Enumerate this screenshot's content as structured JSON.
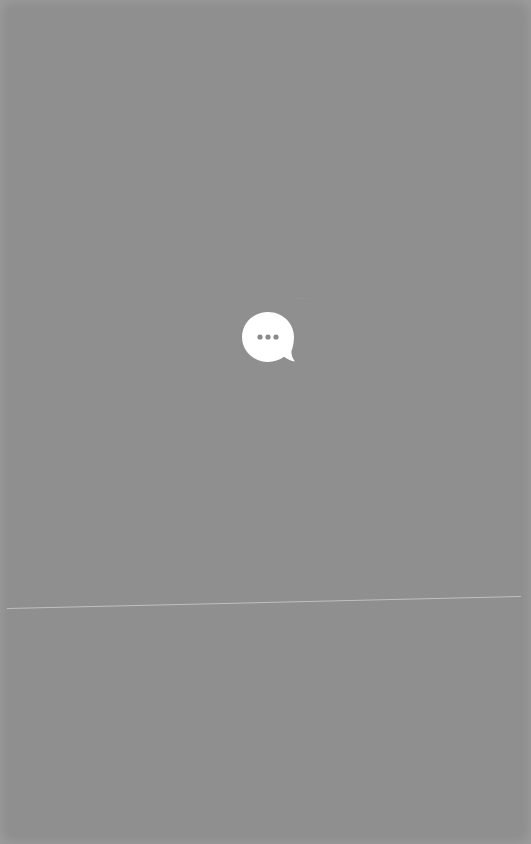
{
  "screen": {
    "state": "loading",
    "overlay_color": "#8f8f8f",
    "border_color": "#9b9b9b"
  },
  "loading_indicator": {
    "icon": "chat-bubble-ellipsis-icon",
    "bubble_color": "#ffffff",
    "dots_color": "#8a8a8a",
    "dots": 3
  },
  "ghost_text": {
    "label": "..."
  }
}
